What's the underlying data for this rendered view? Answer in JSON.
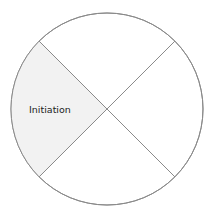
{
  "diagram": {
    "type": "quartered-circle",
    "center": {
      "x": 107,
      "y": 109
    },
    "radius": 96,
    "colors": {
      "stroke": "#8a8a8a",
      "highlight_fill": "#f2f2f2",
      "default_fill": "#ffffff",
      "label": "#222222"
    },
    "segments": [
      {
        "position": "top",
        "label": "",
        "highlighted": false
      },
      {
        "position": "right",
        "label": "",
        "highlighted": false
      },
      {
        "position": "bottom",
        "label": "",
        "highlighted": false
      },
      {
        "position": "left",
        "label": "Initiation",
        "highlighted": true
      }
    ]
  }
}
